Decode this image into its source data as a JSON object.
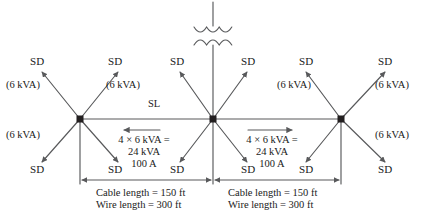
{
  "diagram": {
    "type": "electrical-one-line-distribution-diagram",
    "colors": {
      "line": "#58595b",
      "node": "#231f20",
      "text": "#1a1a1a",
      "background": "#ffffff"
    },
    "transformer": {
      "name": "transformer-symbol",
      "windings": 2,
      "arcs_per_winding": 3
    },
    "nodes": [
      {
        "name": "left-node",
        "x": 80,
        "y": 119
      },
      {
        "name": "center-node",
        "x": 213,
        "y": 119
      },
      {
        "name": "right-node",
        "x": 341,
        "y": 119
      }
    ],
    "service_drops": {
      "label": "SD",
      "count": 12,
      "top_row": [
        {
          "label": "SD",
          "x": 40,
          "y": 62
        },
        {
          "label": "SD",
          "x": 118,
          "y": 62
        },
        {
          "label": "SD",
          "x": 178,
          "y": 62
        },
        {
          "label": "SD",
          "x": 248,
          "y": 62
        },
        {
          "label": "SD",
          "x": 308,
          "y": 62
        },
        {
          "label": "SD",
          "x": 386,
          "y": 62
        }
      ],
      "bottom_row": [
        {
          "label": "SD",
          "x": 40,
          "y": 170
        },
        {
          "label": "SD",
          "x": 118,
          "y": 170
        },
        {
          "label": "SD",
          "x": 178,
          "y": 170
        },
        {
          "label": "SD",
          "x": 248,
          "y": 170
        },
        {
          "label": "SD",
          "x": 308,
          "y": 170
        },
        {
          "label": "SD",
          "x": 386,
          "y": 170
        }
      ]
    },
    "kva_labels": [
      {
        "text": "(6 kVA)",
        "x": 6,
        "y": 84,
        "name": "kva-label-upper-left-outer"
      },
      {
        "text": "(6 kVA)",
        "x": 108,
        "y": 84,
        "name": "kva-label-upper-left-inner"
      },
      {
        "text": "(6 kVA)",
        "x": 6,
        "y": 134,
        "name": "kva-label-lower-left-outer"
      },
      {
        "text": "(6 kVA)",
        "x": 278,
        "y": 84,
        "name": "kva-label-upper-right-inner"
      },
      {
        "text": "(6 kVA)",
        "x": 378,
        "y": 84,
        "name": "kva-label-upper-right-outer"
      },
      {
        "text": "(6 kVA)",
        "x": 378,
        "y": 134,
        "name": "kva-label-lower-right-outer"
      }
    ],
    "source_label": {
      "text": "SL",
      "x": 150,
      "y": 100
    },
    "flow_left": {
      "name": "flow-annotation-left",
      "line1": "4 × 6 kVA =",
      "line2": "24 kVA",
      "line3": "100 A",
      "arrow_direction": "left"
    },
    "flow_right": {
      "name": "flow-annotation-right",
      "line1": "4 × 6 kVA =",
      "line2": "24 kVA",
      "line3": "100 A",
      "arrow_direction": "right"
    },
    "dimension_left": {
      "name": "dimension-left",
      "line1": "Cable length = 150 ft",
      "line2": "Wire length = 300 ft"
    },
    "dimension_right": {
      "name": "dimension-right",
      "line1": "Cable length = 150 ft",
      "line2": "Wire length = 300 ft"
    }
  }
}
